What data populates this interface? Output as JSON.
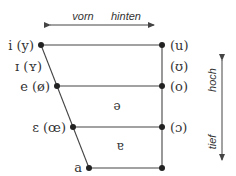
{
  "diagram": {
    "horizontal_axis": {
      "left_label": "vorn",
      "right_label": "hinten"
    },
    "vertical_axis": {
      "top_label": "hoch",
      "bottom_label": "tief"
    },
    "vowels": {
      "close_front": "i (y)",
      "near_close_front": "ɪ (ʏ)",
      "close_mid_front": "e (ø)",
      "open_mid_front": "ɛ (œ)",
      "open_front": "a",
      "close_back": "(u)",
      "near_close_back": "(ʊ)",
      "close_mid_back": "(o)",
      "open_mid_back": "(ɔ)",
      "mid_central": "ə",
      "near_open_central": "ɐ"
    },
    "colors": {
      "line": "#444444",
      "text": "#333333"
    }
  }
}
